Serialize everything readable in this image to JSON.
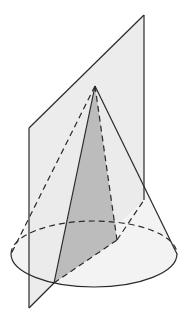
{
  "figure": {
    "colors": {
      "background": "#ffffff",
      "plane_fill": "#ececec",
      "cone_fill": "#f2f2f2",
      "section_fill": "#bdbdbd",
      "base_fill": "#e4e4e4",
      "stroke": "#2a2a2a"
    }
  }
}
